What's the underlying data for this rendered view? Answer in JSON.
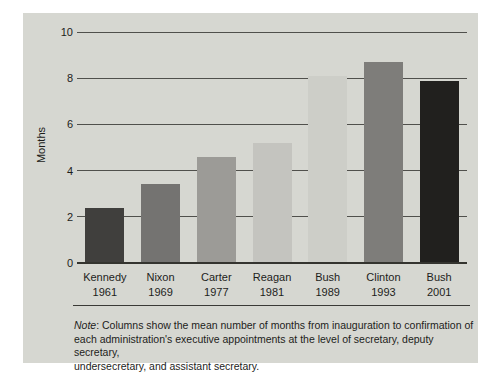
{
  "chart_data": {
    "type": "bar",
    "categories": [
      "Kennedy",
      "Nixon",
      "Carter",
      "Reagan",
      "Bush",
      "Clinton",
      "Bush"
    ],
    "years": [
      "1961",
      "1969",
      "1977",
      "1981",
      "1989",
      "1993",
      "2001"
    ],
    "values": [
      2.4,
      3.4,
      4.6,
      5.2,
      8.1,
      8.7,
      7.9
    ],
    "bar_colors": [
      "#403f3d",
      "#747371",
      "#9c9b97",
      "#c4c4bf",
      "#cdcec8",
      "#7e7d7a",
      "#21201e"
    ],
    "title": "",
    "xlabel": "",
    "ylabel": "Months",
    "yticks": [
      0,
      2,
      4,
      6,
      8,
      10
    ],
    "ylim": [
      0,
      10
    ],
    "grid": true,
    "legend": false
  },
  "note": {
    "label": "Note",
    "line1_rest": ": Columns show the mean number of months from inauguration to confirmation of",
    "line2": "each administration's executive appointments at the level of secretary, deputy secretary,",
    "line3": "undersecretary, and assistant secretary."
  },
  "colors": {
    "panel_bg": "#d6d7d1",
    "gridline": "#50504c",
    "axis_line": "#34342f",
    "text": "#1d1d1b",
    "page_bg": "#ffffff"
  }
}
